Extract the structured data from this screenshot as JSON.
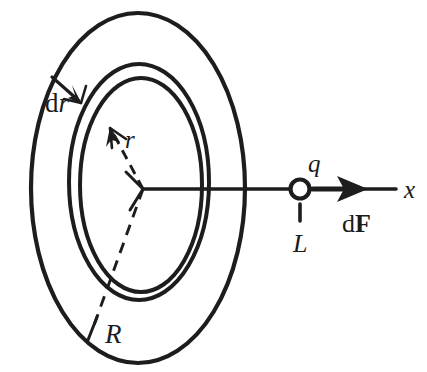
{
  "figure": {
    "background_color": "#ffffff",
    "ink_color": "#1d1d1d",
    "width": 427,
    "height": 372
  },
  "labels": {
    "dr": "d",
    "dr_var": "r",
    "r": "r",
    "R": "R",
    "q": "q",
    "L": "L",
    "dF_d": "d",
    "dF_vec": "F",
    "x": "x"
  },
  "geometry": {
    "center": {
      "x": 143,
      "y": 189
    },
    "outer_disc": {
      "cx": 138,
      "cy": 188,
      "rx": 107,
      "ry": 175
    },
    "ring_outer": {
      "cx": 138,
      "cy": 182,
      "rx": 70,
      "ry": 118
    },
    "ring_inner": {
      "cx": 138,
      "cy": 184,
      "rx": 62,
      "ry": 108
    },
    "charge_circle": {
      "cx": 300,
      "cy": 189,
      "r": 10
    },
    "axis_line": {
      "x1": 143,
      "y1": 189,
      "x2": 396,
      "y2": 189
    },
    "force_arrow": {
      "x1": 313,
      "y1": 189,
      "x2": 366,
      "y2": 189
    },
    "tick_L": {
      "x": 300,
      "y1": 205,
      "y2": 222
    }
  },
  "elements": [
    {
      "name": "outer-disc-outline",
      "kind": "ellipse",
      "role": "radius-R boundary of charged disc"
    },
    {
      "name": "ring-outer-outline",
      "kind": "ellipse",
      "role": "outer edge of differential ring"
    },
    {
      "name": "ring-inner-outline",
      "kind": "ellipse",
      "role": "inner edge of differential ring"
    },
    {
      "name": "radius-r-dashed",
      "kind": "dashed-line-with-arrow",
      "role": "radius r of differential ring"
    },
    {
      "name": "radius-R-dashed",
      "kind": "dashed-line",
      "role": "radius R of disc"
    },
    {
      "name": "dr-arrow",
      "kind": "line-with-arrow",
      "role": "ring thickness dr"
    },
    {
      "name": "axis-line",
      "kind": "line",
      "role": "x axis through disc center"
    },
    {
      "name": "charge-marker",
      "kind": "circle",
      "role": "point charge q"
    },
    {
      "name": "force-arrow",
      "kind": "arrow",
      "role": "differential force dF"
    },
    {
      "name": "distance-tick",
      "kind": "tick",
      "role": "distance L from disc to charge"
    }
  ]
}
